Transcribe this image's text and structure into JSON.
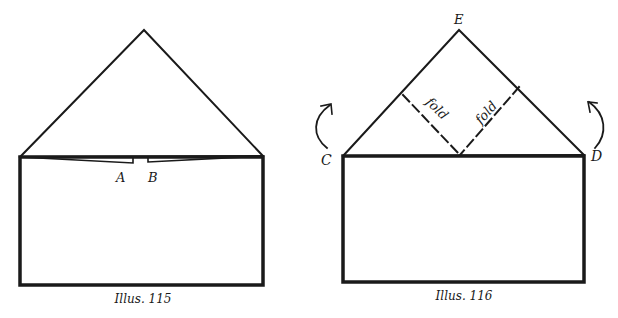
{
  "illustrations": [
    {
      "caption": "Illus. 115",
      "labels": {
        "a": "A",
        "b": "B"
      }
    },
    {
      "caption": "Illus. 116",
      "labels": {
        "c": "C",
        "d": "D",
        "e": "E",
        "fold_left": "fold",
        "fold_right": "fold"
      }
    }
  ],
  "colors": {
    "ink": "#1a1a1a",
    "background": "#ffffff"
  }
}
